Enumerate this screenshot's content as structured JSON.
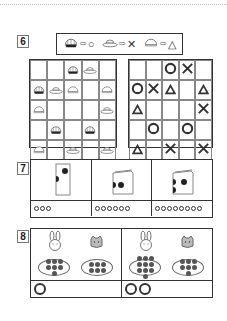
{
  "page": {
    "divider": "dotted top rule"
  },
  "q6": {
    "number": "6",
    "legend": [
      {
        "hat": "dark-striped-dome-hat",
        "arrow": "⇨",
        "symbol": "○"
      },
      {
        "hat": "wide-brim-hat",
        "arrow": "⇨",
        "symbol": "✕"
      },
      {
        "hat": "plain-dome-hat",
        "arrow": "⇨",
        "symbol": "△"
      }
    ],
    "hat_grid": [
      [
        "",
        "",
        "dark",
        "brim",
        ""
      ],
      [
        "dark",
        "brim",
        "plain",
        "",
        "plain"
      ],
      [
        "plain",
        "",
        "",
        "",
        "brim"
      ],
      [
        "",
        "dark",
        "",
        "dark",
        ""
      ],
      [
        "plain",
        "",
        "brim",
        "",
        "brim"
      ]
    ],
    "answer_grid": [
      [
        "",
        "",
        "O",
        "X",
        ""
      ],
      [
        "O",
        "X",
        "△",
        "",
        "△"
      ],
      [
        "△",
        "",
        "",
        "",
        "X"
      ],
      [
        "",
        "O",
        "",
        "O",
        ""
      ],
      [
        "△",
        "",
        "X",
        "",
        "X"
      ]
    ]
  },
  "q7": {
    "number": "7",
    "panels": [
      {
        "card": "tall-folded-card",
        "dots_front": 1,
        "dots_side": 1,
        "answer_circles": 3
      },
      {
        "card": "open-folded-card",
        "dots_front": 1,
        "dots_side": 1,
        "answer_circles": 6
      },
      {
        "card": "open-folded-card",
        "dots_front": 1,
        "dots_side": 2,
        "answer_circles": 8
      }
    ]
  },
  "q8": {
    "number": "8",
    "panels": [
      {
        "animals": [
          "rabbit",
          "cat"
        ],
        "rabbit_apples": 7,
        "cat_apples": 6,
        "answer_circles": 1
      },
      {
        "animals": [
          "rabbit",
          "cat"
        ],
        "rabbit_apples": 10,
        "cat_apples": 7,
        "answer_circles": 2
      }
    ]
  }
}
